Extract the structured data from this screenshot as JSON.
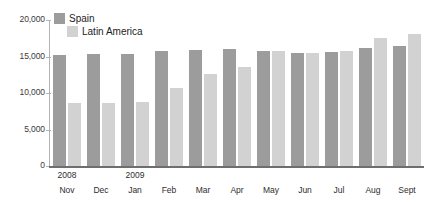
{
  "chart_data": {
    "type": "bar",
    "title": "",
    "subtitle": "",
    "xlabel": "",
    "ylabel": "",
    "ylim": [
      0,
      20000
    ],
    "yticks": [
      0,
      5000,
      10000,
      15000,
      20000
    ],
    "ytick_labels": [
      "0",
      "5,000",
      "10,000",
      "15,000",
      "20,000"
    ],
    "grid": false,
    "legend_position": "top-left",
    "categories": [
      "Nov",
      "Dec",
      "Jan",
      "Feb",
      "Mar",
      "Apr",
      "May",
      "Jun",
      "Jul",
      "Aug",
      "Sept"
    ],
    "category_years": [
      "2008",
      "",
      "2009",
      "",
      "",
      "",
      "",
      "",
      "",
      "",
      ""
    ],
    "series": [
      {
        "name": "Spain",
        "color": "#9c9c9c",
        "values": [
          15200,
          15400,
          15300,
          15800,
          15900,
          16000,
          15700,
          15500,
          15600,
          16200,
          16500
        ]
      },
      {
        "name": "Latin America",
        "color": "#d2d2d2",
        "values": [
          8700,
          8600,
          8800,
          10700,
          12600,
          13600,
          15700,
          15500,
          15800,
          17600,
          18100
        ]
      }
    ]
  },
  "legend": {
    "items": [
      {
        "label": "Spain"
      },
      {
        "label": "Latin America"
      }
    ]
  },
  "axis": {
    "y_labels": [
      "20,000",
      "15,000",
      "10,000",
      "5,000",
      "0"
    ]
  },
  "colors": {
    "spain": "#9c9c9c",
    "latin_america": "#d2d2d2",
    "axis": "#b4b4b4",
    "baseline": "#6e6e6e",
    "text": "#2e2e2e"
  }
}
